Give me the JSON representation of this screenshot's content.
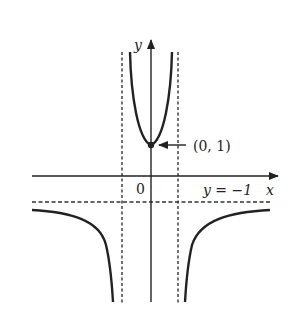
{
  "diagram": {
    "type": "function-graph",
    "axes": {
      "x_label": "x",
      "y_label": "y",
      "origin_label": "0"
    },
    "point": {
      "label": "(0, 1)",
      "x": 0,
      "y": 1
    },
    "asymptotes": {
      "horizontal_label": "y = −1",
      "horizontal_value": -1,
      "vertical_values": [
        -1,
        1
      ]
    },
    "colors": {
      "curve": "#222222",
      "axes": "#222222",
      "asymptote": "#333333",
      "background": "#ffffff"
    }
  }
}
